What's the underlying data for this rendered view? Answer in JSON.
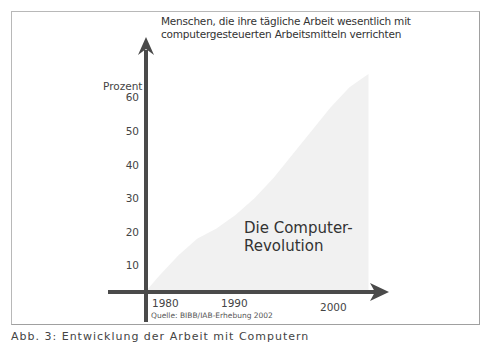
{
  "chart_data": {
    "type": "area",
    "title": "Menschen, die ihre tägliche Arbeit wesentlich mit computergesteuerten Arbeitsmitteln verrichten",
    "title_lines": [
      "Menschen, die ihre tägliche Arbeit wesentlich mit",
      "computergesteuerten Arbeitsmitteln verrichten"
    ],
    "ylabel": "Prozent",
    "xlabel": "",
    "y_ticks": [
      10,
      20,
      30,
      40,
      50,
      60
    ],
    "x_ticks": [
      1980,
      1990,
      2000
    ],
    "ylim": [
      0,
      70
    ],
    "xlim": [
      1976,
      2010
    ],
    "grid": false,
    "series": [
      {
        "name": "Die Computer-Revolution",
        "x": [
          1979.5,
          1981,
          1983,
          1985,
          1987,
          1989,
          1991,
          1993,
          1995,
          1997,
          1999,
          2001,
          2002.5,
          2003
        ],
        "values": [
          0,
          7,
          13,
          18,
          21,
          25,
          30,
          36,
          43,
          50,
          57,
          63,
          66,
          67
        ],
        "color": "#f1f1f1"
      }
    ],
    "annotation_lines": [
      "Die Computer-",
      "Revolution"
    ],
    "source": "Quelle: BIBB/IAB-Erhebung 2002",
    "axis_color": "#4a4a4a"
  },
  "caption_partial": "Abb. 3: Entwicklung der Arbeit mit Computern"
}
